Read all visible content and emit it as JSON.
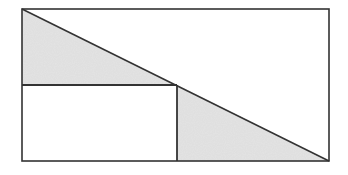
{
  "diagram": {
    "colors": {
      "background": "#ffffff",
      "stroke": "#333333",
      "shade": "#e4e4e4",
      "shadow": "#9a9a9a"
    },
    "outer_rectangle": {
      "x1": 22,
      "y1": 9,
      "x2": 329,
      "y2": 161
    },
    "diagonal": {
      "x1": 22,
      "y1": 9,
      "x2": 329,
      "y2": 161
    },
    "horizontal_divider": {
      "x1": 22,
      "y1": 85,
      "x2": 177,
      "y2": 85
    },
    "vertical_divider": {
      "x1": 177,
      "y1": 85,
      "x2": 177,
      "y2": 161
    },
    "shaded_triangles": [
      {
        "name": "upper-left-triangle",
        "points": "22,9 22,85 175,85"
      },
      {
        "name": "lower-right-triangle",
        "points": "177,85 177,161 329,161"
      }
    ],
    "inner_rectangle": {
      "x1": 22,
      "y1": 85,
      "x2": 177,
      "y2": 161,
      "shaded": false
    }
  }
}
